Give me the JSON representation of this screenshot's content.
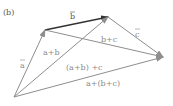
{
  "figure": {
    "panel_label": "(b)",
    "colors": {
      "vector_gray": "#8e8e8e",
      "vector_dark": "#333333",
      "label_gray": "#8a8a8a",
      "label_dark": "#555555",
      "background": "#ffffff"
    },
    "points": {
      "O": [
        14,
        97
      ],
      "A": [
        45,
        30
      ],
      "B": [
        108,
        17
      ],
      "C": [
        163,
        57
      ]
    },
    "vectors": [
      {
        "name": "a",
        "from": "O",
        "to": "A",
        "label": "a"
      },
      {
        "name": "b",
        "from": "A",
        "to": "B",
        "label": "b"
      },
      {
        "name": "c",
        "from": "B",
        "to": "C",
        "label": "c"
      },
      {
        "name": "a_plus_b",
        "from": "O",
        "to": "B",
        "label": "a+b"
      },
      {
        "name": "b_plus_c",
        "from": "A",
        "to": "C",
        "label": "b+c"
      },
      {
        "name": "a_plus_b_plus_c_grouped_left",
        "from": "O",
        "to": "C",
        "label": "(a+b)+c"
      },
      {
        "name": "a_plus_b_plus_c_grouped_right",
        "from": "O",
        "to": "C",
        "label": "a+(b+c)"
      }
    ],
    "labels": {
      "panel": "(b)",
      "a": "a",
      "b": "b",
      "c": "c",
      "a_plus_b": "a+b",
      "b_plus_c": "b+c",
      "ab_plus_c": "(a+b) +c",
      "a_plus_bc": "a+(b+c)"
    }
  }
}
